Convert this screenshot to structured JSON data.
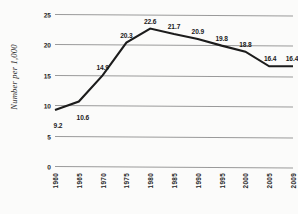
{
  "chart_data": {
    "type": "line",
    "title": "",
    "xlabel": "",
    "ylabel": "Number per 1,000",
    "categories": [
      "1960",
      "1965",
      "1970",
      "1975",
      "1980",
      "1985",
      "1990",
      "1995",
      "2000",
      "2005",
      "2009"
    ],
    "values": [
      9.2,
      10.6,
      14.9,
      20.3,
      22.6,
      21.7,
      20.9,
      19.8,
      18.8,
      16.4,
      16.4
    ],
    "point_labels": [
      "9.2",
      "10.6",
      "14.9",
      "20.3",
      "22.6",
      "21.7",
      "20.9",
      "19.8",
      "18.8",
      "16.4",
      "16.4"
    ],
    "ylim": [
      0,
      25
    ],
    "yticks": [
      0,
      5,
      10,
      15,
      20,
      25
    ],
    "ytick_labels": [
      "0",
      "5",
      "10",
      "15",
      "20",
      "25"
    ],
    "grid": true,
    "legend": "none",
    "series_color": "#1c1c1c",
    "grid_color": "#9a9a9a",
    "background_color": "#fbfbfa"
  }
}
